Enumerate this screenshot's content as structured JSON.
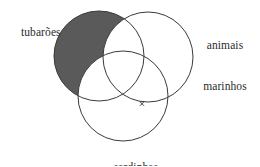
{
  "diagram": {
    "type": "venn-3-set",
    "background_color": "#ffffff",
    "stroke_color": "#3a3a3a",
    "shaded_fill_color": "#5a5a5a",
    "labels": {
      "set_left": "tubarões",
      "set_right_line1": "animais",
      "set_right_line2": "marinhos",
      "set_bottom": "sardinhas"
    },
    "marks": [
      {
        "name": "x-mark",
        "glyph": "×",
        "x": 142,
        "y": 104,
        "region": "animais marinhos ∩ sardinhas, excluding tubarões"
      }
    ],
    "circles": [
      {
        "name": "tubaroes",
        "cx": 99,
        "cy": 56,
        "r": 45,
        "shaded": true
      },
      {
        "name": "animais-marinhos",
        "cx": 148,
        "cy": 57,
        "r": 45,
        "shaded": false
      },
      {
        "name": "sardinhas",
        "cx": 123,
        "cy": 96,
        "r": 45,
        "shaded": false
      }
    ],
    "shaded_region_description": "tubarões only (excluding animais marinhos and sardinhas)"
  }
}
